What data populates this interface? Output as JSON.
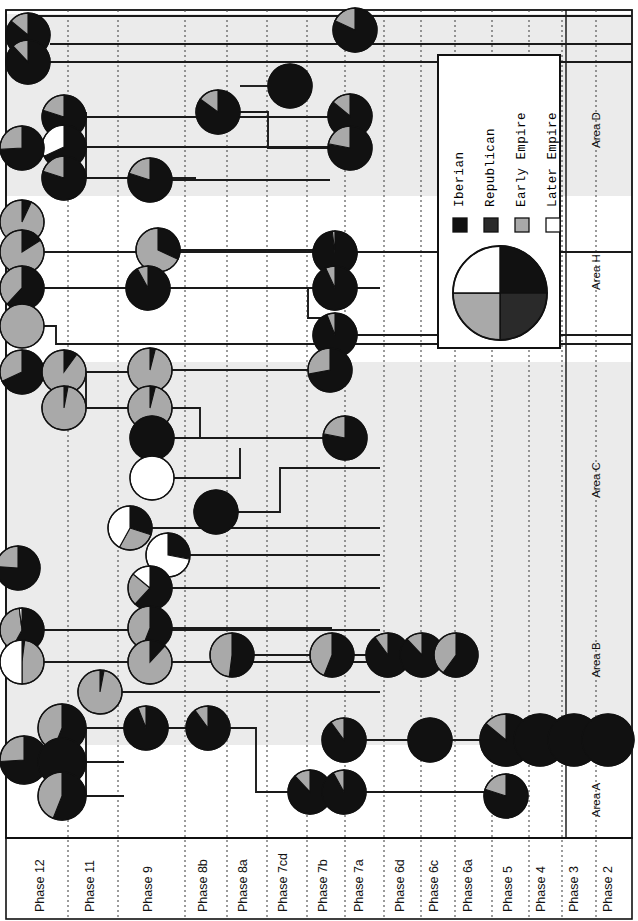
{
  "figure": {
    "type": "harris-matrix-pie-diagram",
    "width": 638,
    "height": 921,
    "background": "#ffffff",
    "line_color": "#1a1a1a",
    "band_color": "#ebebeb"
  },
  "palette": {
    "iberian": "#111111",
    "republican": "#2a2a2a",
    "early_empire": "#a9a9a9",
    "later_empire": "#ffffff",
    "outline": "#111111",
    "grid": "#4a4a4a"
  },
  "legend": {
    "box": {
      "x": 438,
      "y": 55,
      "width": 122,
      "height": 293
    },
    "entries": [
      {
        "key": "iberian",
        "label": "Iberian",
        "color": "#111111"
      },
      {
        "key": "republican",
        "label": "Republican",
        "color": "#2a2a2a"
      },
      {
        "key": "early_empire",
        "label": "Early Empire",
        "color": "#a9a9a9"
      },
      {
        "key": "later_empire",
        "label": "Later Empire",
        "color": "#ffffff"
      }
    ],
    "key_pie": {
      "note": "four equal quarters showing all four period fills",
      "quarters": [
        "iberian",
        "republican",
        "early_empire",
        "later_empire"
      ]
    }
  },
  "axes": {
    "phase_axis_label": "Phase",
    "phases": [
      {
        "label": "Phase 12",
        "x": 44
      },
      {
        "label": "Phase 11",
        "x": 94
      },
      {
        "label": "Phase 9",
        "x": 152
      },
      {
        "label": "Phase 8b",
        "x": 207
      },
      {
        "label": "Phase 8a",
        "x": 247
      },
      {
        "label": "Phase 7cd",
        "x": 287
      },
      {
        "label": "Phase 7b",
        "x": 327
      },
      {
        "label": "Phase 7a",
        "x": 363
      },
      {
        "label": "Phase 6d",
        "x": 404
      },
      {
        "label": "Phase 6c",
        "x": 438
      },
      {
        "label": "Phase 6a",
        "x": 472
      },
      {
        "label": "Phase 5",
        "x": 512
      },
      {
        "label": "Phase 4",
        "x": 545
      },
      {
        "label": "Phase 3",
        "x": 578
      },
      {
        "label": "Phase 2",
        "x": 612
      }
    ],
    "phase_gridlines": [
      68,
      118,
      185,
      227,
      267,
      307,
      345,
      384,
      421,
      455,
      492,
      529,
      562,
      596
    ],
    "areas": [
      {
        "label": "Area A",
        "x": 600,
        "y": 800
      },
      {
        "label": "Area B",
        "x": 600,
        "y": 660
      },
      {
        "label": "Area C",
        "x": 600,
        "y": 480
      },
      {
        "label": "Area H",
        "x": 600,
        "y": 272
      },
      {
        "label": "Area D",
        "x": 600,
        "y": 130
      }
    ],
    "area_bands": [
      {
        "label": "Area A",
        "y": 745,
        "height": 90,
        "shaded": false
      },
      {
        "label": "Area B",
        "y": 605,
        "height": 140,
        "shaded": true
      },
      {
        "label": "Area C",
        "y": 362,
        "height": 243,
        "shaded": true
      },
      {
        "label": "Area H",
        "y": 196,
        "height": 166,
        "shaded": false
      },
      {
        "label": "Area D",
        "y": 14,
        "height": 182,
        "shaded": true
      }
    ],
    "area_divider_x": 566,
    "frame": {
      "left": 6,
      "top": 10,
      "right": 632,
      "bottom": 838
    }
  },
  "chart_data": {
    "type": "node-link-pie",
    "categories": [
      "iberian",
      "republican",
      "early_empire",
      "later_empire"
    ],
    "nodes": [
      {
        "id": "n01",
        "x": 28,
        "y": 35,
        "r": 22,
        "values": [
          0.86,
          0,
          0.14,
          0
        ]
      },
      {
        "id": "n02",
        "x": 28,
        "y": 62,
        "r": 22,
        "values": [
          0.88,
          0,
          0.12,
          0
        ]
      },
      {
        "id": "n03",
        "x": 355,
        "y": 30,
        "r": 22,
        "values": [
          0.82,
          0,
          0.18,
          0
        ]
      },
      {
        "id": "n04",
        "x": 64,
        "y": 117,
        "r": 22,
        "values": [
          0.8,
          0,
          0.2,
          0
        ]
      },
      {
        "id": "n05",
        "x": 64,
        "y": 147,
        "r": 22,
        "values": [
          0.68,
          0,
          0,
          0.32
        ]
      },
      {
        "id": "n06",
        "x": 64,
        "y": 178,
        "r": 22,
        "values": [
          0.8,
          0,
          0.2,
          0
        ]
      },
      {
        "id": "n07",
        "x": 22,
        "y": 148,
        "r": 22,
        "values": [
          0.74,
          0,
          0.26,
          0
        ]
      },
      {
        "id": "n08",
        "x": 218,
        "y": 112,
        "r": 22,
        "values": [
          0.85,
          0,
          0.15,
          0
        ]
      },
      {
        "id": "n09",
        "x": 290,
        "y": 86,
        "r": 22,
        "values": [
          1.0,
          0,
          0,
          0
        ]
      },
      {
        "id": "n10",
        "x": 350,
        "y": 116,
        "r": 22,
        "values": [
          0.86,
          0,
          0.14,
          0
        ]
      },
      {
        "id": "n11",
        "x": 350,
        "y": 148,
        "r": 22,
        "values": [
          0.78,
          0,
          0.22,
          0
        ]
      },
      {
        "id": "n12",
        "x": 150,
        "y": 180,
        "r": 22,
        "values": [
          0.8,
          0,
          0.2,
          0
        ]
      },
      {
        "id": "n13",
        "x": 22,
        "y": 222,
        "r": 22,
        "values": [
          0.07,
          0,
          0.93,
          0
        ]
      },
      {
        "id": "n14",
        "x": 22,
        "y": 252,
        "r": 22,
        "values": [
          0.16,
          0,
          0.84,
          0
        ]
      },
      {
        "id": "n15",
        "x": 22,
        "y": 288,
        "r": 22,
        "values": [
          0.62,
          0,
          0.38,
          0
        ]
      },
      {
        "id": "n16",
        "x": 22,
        "y": 326,
        "r": 22,
        "values": [
          0,
          0,
          1.0,
          0
        ]
      },
      {
        "id": "n17",
        "x": 158,
        "y": 250,
        "r": 22,
        "values": [
          0.32,
          0,
          0.68,
          0
        ]
      },
      {
        "id": "n18",
        "x": 148,
        "y": 288,
        "r": 22,
        "values": [
          0.92,
          0,
          0.08,
          0
        ]
      },
      {
        "id": "n19",
        "x": 335,
        "y": 253,
        "r": 22,
        "values": [
          0.98,
          0,
          0.02,
          0
        ]
      },
      {
        "id": "n20",
        "x": 335,
        "y": 288,
        "r": 22,
        "values": [
          0.93,
          0,
          0.07,
          0
        ]
      },
      {
        "id": "n21",
        "x": 335,
        "y": 335,
        "r": 22,
        "values": [
          0.94,
          0,
          0.06,
          0
        ]
      },
      {
        "id": "n22",
        "x": 22,
        "y": 372,
        "r": 22,
        "values": [
          0.68,
          0,
          0.32,
          0
        ]
      },
      {
        "id": "n23",
        "x": 64,
        "y": 372,
        "r": 22,
        "values": [
          0.1,
          0,
          0.9,
          0
        ]
      },
      {
        "id": "n24",
        "x": 64,
        "y": 408,
        "r": 22,
        "values": [
          0.03,
          0,
          0.97,
          0
        ]
      },
      {
        "id": "n25",
        "x": 150,
        "y": 370,
        "r": 22,
        "values": [
          0.04,
          0,
          0.96,
          0
        ]
      },
      {
        "id": "n26",
        "x": 150,
        "y": 408,
        "r": 22,
        "values": [
          0.04,
          0,
          0.96,
          0
        ]
      },
      {
        "id": "n27",
        "x": 152,
        "y": 438,
        "r": 22,
        "values": [
          1.0,
          0,
          0,
          0
        ]
      },
      {
        "id": "n28",
        "x": 152,
        "y": 478,
        "r": 22,
        "values": [
          0,
          0,
          0,
          1.0
        ]
      },
      {
        "id": "n29",
        "x": 330,
        "y": 370,
        "r": 22,
        "values": [
          0.72,
          0,
          0.28,
          0
        ]
      },
      {
        "id": "n30",
        "x": 345,
        "y": 438,
        "r": 22,
        "values": [
          0.78,
          0,
          0.22,
          0
        ]
      },
      {
        "id": "n31",
        "x": 130,
        "y": 528,
        "r": 22,
        "values": [
          0.3,
          0,
          0.28,
          0.42
        ]
      },
      {
        "id": "n32",
        "x": 168,
        "y": 555,
        "r": 22,
        "values": [
          0.28,
          0,
          0,
          0.72
        ]
      },
      {
        "id": "n33",
        "x": 216,
        "y": 512,
        "r": 22,
        "values": [
          1.0,
          0,
          0,
          0
        ]
      },
      {
        "id": "n34",
        "x": 18,
        "y": 568,
        "r": 22,
        "values": [
          0.76,
          0,
          0.24,
          0
        ]
      },
      {
        "id": "n35",
        "x": 150,
        "y": 588,
        "r": 22,
        "values": [
          0.62,
          0,
          0.24,
          0.14
        ]
      },
      {
        "id": "n36",
        "x": 22,
        "y": 630,
        "r": 22,
        "values": [
          0.58,
          0,
          0.4,
          0.02
        ]
      },
      {
        "id": "n37",
        "x": 150,
        "y": 628,
        "r": 22,
        "values": [
          0.56,
          0,
          0.44,
          0
        ]
      },
      {
        "id": "n38",
        "x": 22,
        "y": 662,
        "r": 22,
        "values": [
          0.02,
          0,
          0.48,
          0.5
        ]
      },
      {
        "id": "n39",
        "x": 150,
        "y": 662,
        "r": 22,
        "values": [
          0.12,
          0,
          0.88,
          0
        ]
      },
      {
        "id": "n40",
        "x": 100,
        "y": 692,
        "r": 22,
        "values": [
          0.03,
          0,
          0.97,
          0
        ]
      },
      {
        "id": "n41",
        "x": 232,
        "y": 655,
        "r": 22,
        "values": [
          0.52,
          0,
          0.48,
          0
        ]
      },
      {
        "id": "n42",
        "x": 332,
        "y": 655,
        "r": 22,
        "values": [
          0.56,
          0,
          0.44,
          0
        ]
      },
      {
        "id": "n43",
        "x": 388,
        "y": 655,
        "r": 22,
        "values": [
          0.9,
          0,
          0.1,
          0
        ]
      },
      {
        "id": "n44",
        "x": 422,
        "y": 655,
        "r": 22,
        "values": [
          0.88,
          0,
          0.12,
          0
        ]
      },
      {
        "id": "n45",
        "x": 456,
        "y": 655,
        "r": 22,
        "values": [
          0.6,
          0,
          0.4,
          0
        ]
      },
      {
        "id": "n46",
        "x": 24,
        "y": 760,
        "r": 24,
        "values": [
          0.74,
          0,
          0.26,
          0
        ]
      },
      {
        "id": "n47",
        "x": 62,
        "y": 728,
        "r": 24,
        "values": [
          0.56,
          0,
          0.44,
          0
        ]
      },
      {
        "id": "n48",
        "x": 62,
        "y": 762,
        "r": 24,
        "values": [
          1.0,
          0,
          0,
          0
        ]
      },
      {
        "id": "n49",
        "x": 62,
        "y": 796,
        "r": 24,
        "values": [
          0.56,
          0,
          0.44,
          0
        ]
      },
      {
        "id": "n50",
        "x": 146,
        "y": 728,
        "r": 22,
        "values": [
          0.94,
          0,
          0.06,
          0
        ]
      },
      {
        "id": "n51",
        "x": 208,
        "y": 728,
        "r": 22,
        "values": [
          0.9,
          0,
          0.1,
          0
        ]
      },
      {
        "id": "n52",
        "x": 310,
        "y": 792,
        "r": 22,
        "values": [
          0.88,
          0,
          0.12,
          0
        ]
      },
      {
        "id": "n53",
        "x": 344,
        "y": 792,
        "r": 22,
        "values": [
          0.92,
          0,
          0.08,
          0
        ]
      },
      {
        "id": "n54",
        "x": 344,
        "y": 740,
        "r": 22,
        "values": [
          0.9,
          0,
          0.1,
          0
        ]
      },
      {
        "id": "n55",
        "x": 430,
        "y": 740,
        "r": 22,
        "values": [
          1.0,
          0,
          0,
          0
        ]
      },
      {
        "id": "n56",
        "x": 506,
        "y": 740,
        "r": 26,
        "values": [
          0.86,
          0,
          0.14,
          0
        ]
      },
      {
        "id": "n57",
        "x": 506,
        "y": 796,
        "r": 22,
        "values": [
          0.8,
          0,
          0.2,
          0
        ]
      },
      {
        "id": "n58",
        "x": 540,
        "y": 740,
        "r": 26,
        "values": [
          1.0,
          0,
          0,
          0
        ]
      },
      {
        "id": "n59",
        "x": 574,
        "y": 740,
        "r": 26,
        "values": [
          1.0,
          0,
          0,
          0
        ]
      },
      {
        "id": "n60",
        "x": 608,
        "y": 740,
        "r": 26,
        "values": [
          1.0,
          0,
          0,
          0
        ]
      }
    ],
    "links": [
      {
        "path": "M 50,44 L 632,44"
      },
      {
        "path": "M 50,62 L 632,62"
      },
      {
        "path": "M 22,16 L 632,16"
      },
      {
        "path": "M 86,117 L 330,117"
      },
      {
        "path": "M 86,147 L 330,147"
      },
      {
        "path": "M 86,178 L 196,178"
      },
      {
        "path": "M 86,112 L 86,178"
      },
      {
        "path": "M 240,112 L 268,112 L 268,148 L 330,148"
      },
      {
        "path": "M 240,86 L 268,86"
      },
      {
        "path": "M 172,180 L 330,180"
      },
      {
        "path": "M 44,252 L 632,252"
      },
      {
        "path": "M 44,288 L 380,288"
      },
      {
        "path": "M 180,250 L 313,250"
      },
      {
        "path": "M 44,326 L 56,326 L 56,344 L 632,344"
      },
      {
        "path": "M 170,288 L 308,288 L 308,318 L 325,318 L 325,335 L 632,335"
      },
      {
        "path": "M 86,372 L 128,372"
      },
      {
        "path": "M 86,408 L 128,408"
      },
      {
        "path": "M 86,372 L 86,408"
      },
      {
        "path": "M 172,370 L 308,370"
      },
      {
        "path": "M 172,408 L 200,408 L 200,438 L 330,438"
      },
      {
        "path": "M 174,438 L 240,438"
      },
      {
        "path": "M 174,478 L 240,478 L 240,448"
      },
      {
        "path": "M 238,512 L 280,512 L 280,468 L 380,468"
      },
      {
        "path": "M 190,555 L 380,555"
      },
      {
        "path": "M 152,528 L 380,528"
      },
      {
        "path": "M 172,588 L 380,588"
      },
      {
        "path": "M 44,630 L 380,630"
      },
      {
        "path": "M 44,662 L 380,662"
      },
      {
        "path": "M 122,692 L 380,692"
      },
      {
        "path": "M 172,628 L 332,628"
      },
      {
        "path": "M 254,655 L 310,655"
      },
      {
        "path": "M 354,655 L 388,655"
      },
      {
        "path": "M 86,728 L 124,728"
      },
      {
        "path": "M 86,762 L 124,762"
      },
      {
        "path": "M 86,796 L 124,796"
      },
      {
        "path": "M 86,728 L 86,796"
      },
      {
        "path": "M 168,728 L 208,728"
      },
      {
        "path": "M 230,728 L 256,728 L 256,792 L 290,792"
      },
      {
        "path": "M 366,740 L 430,740"
      },
      {
        "path": "M 452,740 L 632,740"
      },
      {
        "path": "M 366,792 L 484,792"
      }
    ]
  }
}
